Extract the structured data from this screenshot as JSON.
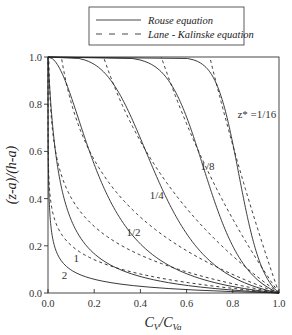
{
  "chart_data": {
    "type": "line",
    "title": "",
    "xlabel": "C_V / C_Va",
    "ylabel": "(z-a)/(h-a)",
    "xlim": [
      0.0,
      1.0
    ],
    "ylim": [
      0.0,
      1.0
    ],
    "xticks": [
      "0.0",
      "0.2",
      "0.4",
      "0.6",
      "0.8",
      "1.0"
    ],
    "yticks": [
      "0.0",
      "0.2",
      "0.4",
      "0.6",
      "0.8",
      "1.0"
    ],
    "grid": false,
    "legend_position": "top-center (above plot)",
    "legend": [
      {
        "label": "Rouse equation",
        "style": "solid"
      },
      {
        "label": "Lane - Kalinske equation",
        "style": "dashed"
      }
    ],
    "a_over_h": 0.05,
    "curve_labels": [
      "z* = 1/16",
      "1/8",
      "1/4",
      "1/2",
      "1",
      "2"
    ],
    "series": [
      {
        "name": "z*=1/16",
        "z_star": 0.0625,
        "label": "z* =1/16"
      },
      {
        "name": "z*=1/8",
        "z_star": 0.125,
        "label": "1/8"
      },
      {
        "name": "z*=1/4",
        "z_star": 0.25,
        "label": "1/4"
      },
      {
        "name": "z*=1/2",
        "z_star": 0.5,
        "label": "1/2"
      },
      {
        "name": "z*=1",
        "z_star": 1.0,
        "label": "1"
      },
      {
        "name": "z*=2",
        "z_star": 2.0,
        "label": "2"
      }
    ],
    "annotations": [
      {
        "text": "z* =1/16",
        "x": 0.82,
        "y": 0.74
      },
      {
        "text": "1/8",
        "x": 0.66,
        "y": 0.52
      },
      {
        "text": "1/4",
        "x": 0.44,
        "y": 0.4
      },
      {
        "text": "1/2",
        "x": 0.34,
        "y": 0.24
      },
      {
        "text": "1",
        "x": 0.11,
        "y": 0.13
      },
      {
        "text": "2",
        "x": 0.06,
        "y": 0.06
      }
    ]
  },
  "legend": {
    "rouse": "Rouse equation",
    "lane": "Lane - Kalinske equation"
  },
  "axes": {
    "xlabel_main": "C",
    "xlabel_sub1": "V",
    "xlabel_sep": "/",
    "xlabel_main2": "C",
    "xlabel_sub2": "Va",
    "ylabel": "(z-a)/(h-a)"
  }
}
